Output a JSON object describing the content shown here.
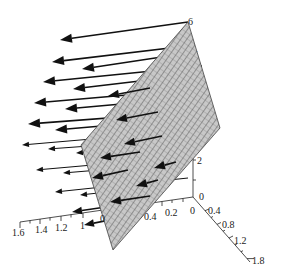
{
  "chart_data": {
    "type": "3d-vector-field",
    "title": "",
    "axes": {
      "x": {
        "ticks": [
          "1.6",
          "1.4",
          "1.2",
          "1",
          "0.4",
          "0.2",
          "0"
        ],
        "range": [
          0,
          1.6
        ]
      },
      "y": {
        "ticks": [
          "0",
          "0.4",
          "0.8",
          "1.2",
          "1.8"
        ],
        "range": [
          0,
          1.8
        ]
      },
      "z": {
        "ticks": [
          "0",
          "2",
          "5",
          "6"
        ],
        "range": [
          0,
          6
        ]
      }
    },
    "plane_label": "0",
    "arrows": [
      {
        "x1": 188,
        "y1": 22,
        "x2": 60,
        "y2": 40,
        "head": 12
      },
      {
        "x1": 195,
        "y1": 45,
        "x2": 52,
        "y2": 62,
        "head": 12
      },
      {
        "x1": 175,
        "y1": 55,
        "x2": 82,
        "y2": 69,
        "head": 12
      },
      {
        "x1": 202,
        "y1": 66,
        "x2": 43,
        "y2": 82,
        "head": 12
      },
      {
        "x1": 182,
        "y1": 76,
        "x2": 73,
        "y2": 89,
        "head": 12
      },
      {
        "x1": 208,
        "y1": 88,
        "x2": 34,
        "y2": 103,
        "head": 12
      },
      {
        "x1": 188,
        "y1": 98,
        "x2": 65,
        "y2": 109,
        "head": 12
      },
      {
        "x1": 214,
        "y1": 110,
        "x2": 28,
        "y2": 124,
        "head": 12
      },
      {
        "x1": 194,
        "y1": 118,
        "x2": 55,
        "y2": 130,
        "head": 12
      },
      {
        "x1": 220,
        "y1": 128,
        "x2": 22,
        "y2": 145,
        "head": 7
      },
      {
        "x1": 200,
        "y1": 138,
        "x2": 48,
        "y2": 149,
        "head": 7
      },
      {
        "x1": 170,
        "y1": 146,
        "x2": 76,
        "y2": 153,
        "head": 7
      },
      {
        "x1": 195,
        "y1": 156,
        "x2": 36,
        "y2": 170,
        "head": 7
      },
      {
        "x1": 172,
        "y1": 164,
        "x2": 63,
        "y2": 173,
        "head": 7
      },
      {
        "x1": 188,
        "y1": 178,
        "x2": 55,
        "y2": 192,
        "head": 7
      },
      {
        "x1": 162,
        "y1": 186,
        "x2": 80,
        "y2": 195,
        "head": 7
      },
      {
        "x1": 140,
        "y1": 202,
        "x2": 72,
        "y2": 212,
        "head": 10
      },
      {
        "x1": 120,
        "y1": 218,
        "x2": 84,
        "y2": 225,
        "head": 10
      }
    ],
    "plane_arrows": [
      {
        "x1": 150,
        "y1": 88,
        "x2": 108,
        "y2": 96
      },
      {
        "x1": 158,
        "y1": 112,
        "x2": 116,
        "y2": 120
      },
      {
        "x1": 162,
        "y1": 136,
        "x2": 124,
        "y2": 144
      },
      {
        "x1": 140,
        "y1": 152,
        "x2": 100,
        "y2": 158
      },
      {
        "x1": 176,
        "y1": 162,
        "x2": 154,
        "y2": 168
      },
      {
        "x1": 128,
        "y1": 170,
        "x2": 92,
        "y2": 178
      },
      {
        "x1": 158,
        "y1": 180,
        "x2": 136,
        "y2": 186
      },
      {
        "x1": 150,
        "y1": 196,
        "x2": 110,
        "y2": 202
      }
    ]
  }
}
